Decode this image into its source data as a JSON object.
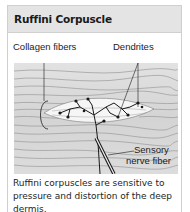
{
  "card": {
    "title": "Ruffini Corpuscle"
  },
  "figure": {
    "labels": {
      "collagen": "Collagen fibers",
      "dendrites": "Dendrites",
      "sensory_line1": "Sensory",
      "sensory_line2": "nerve fiber"
    },
    "colors": {
      "background": "#d9d9d9",
      "capsule": "#f4f4f4",
      "lines": "#1a1a1a"
    }
  },
  "caption": "Ruffini corpuscles are sensitive to pressure and distortion of the deep dermis."
}
